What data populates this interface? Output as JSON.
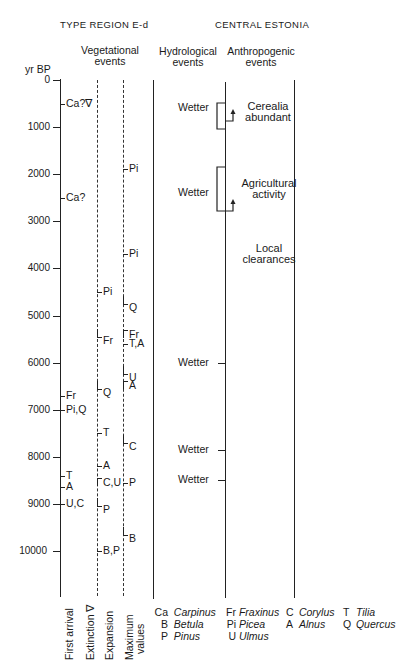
{
  "top_cut_text": "Estonia",
  "headers": {
    "left_region": "TYPE REGION E-d",
    "right_region": "CENTRAL ESTONIA",
    "vegetational": [
      "Vegetational",
      "events"
    ],
    "hydrological": [
      "Hydrological",
      "events"
    ],
    "anthropogenic": [
      "Anthropogenic",
      "events"
    ]
  },
  "axis": {
    "unit": "yr BP",
    "ticks": [
      "0",
      "1000",
      "2000",
      "3000",
      "4000",
      "5000",
      "6000",
      "7000",
      "8000",
      "9000",
      "10000"
    ]
  },
  "first_arrival": [
    {
      "label": "Ca?∇",
      "yr": 500
    },
    {
      "label": "Ca?",
      "yr": 2500
    },
    {
      "label": "Fr",
      "yr": 6700
    },
    {
      "label": "Pi,Q",
      "yr": 7000
    },
    {
      "label": "T",
      "yr": 8400
    },
    {
      "label": "A",
      "yr": 8650
    },
    {
      "label": "U,C",
      "yr": 9000
    }
  ],
  "expansion": [
    {
      "label": "Pi",
      "yr": 4500
    },
    {
      "label": "Fr",
      "yr": 5450
    },
    {
      "label": "Q",
      "yr": 6550
    },
    {
      "label": "T",
      "yr": 7500
    },
    {
      "label": "A",
      "yr": 8200
    },
    {
      "label": "C,U",
      "yr": 8450
    },
    {
      "label": "P",
      "yr": 9050
    },
    {
      "label": "B,P",
      "yr": 10000
    }
  ],
  "maximum_values": [
    {
      "label": "Pi",
      "yr": 1900
    },
    {
      "label": "Pi",
      "yr": 3700
    },
    {
      "label": "Q",
      "yr": 4750
    },
    {
      "label": "Fr",
      "yr": 5300
    },
    {
      "label": "T,A",
      "yr": 5600
    },
    {
      "label": "U",
      "yr": 6250
    },
    {
      "label": "A",
      "yr": 6400
    },
    {
      "label": "C",
      "yr": 7700
    },
    {
      "label": "P",
      "yr": 8550
    },
    {
      "label": "B",
      "yr": 9650
    }
  ],
  "hydrological_events": [
    {
      "label": "Wetter",
      "yr": 600
    },
    {
      "label": "Wetter",
      "yr": 2400
    },
    {
      "label": "Wetter",
      "yr": 6000
    },
    {
      "label": "Wetter",
      "yr": 7850
    },
    {
      "label": "Wetter",
      "yr": 8500
    }
  ],
  "anthropogenic_events": [
    {
      "label": [
        "Cerealia",
        "abundant"
      ]
    },
    {
      "label": [
        "Agricultural",
        "activity"
      ]
    },
    {
      "label": [
        "Local",
        "clearances"
      ]
    }
  ],
  "column_labels": {
    "first_arrival": "First arrival",
    "extinction": "Extinction ∇",
    "expansion": "Expansion",
    "maximum": [
      "Maximum",
      "values"
    ]
  },
  "legend": [
    {
      "abbr": "Ca",
      "name": "Carpinus"
    },
    {
      "abbr": "B",
      "name": "Betula"
    },
    {
      "abbr": "P",
      "name": "Pinus"
    },
    {
      "abbr": "Fr",
      "name": "Fraxinus"
    },
    {
      "abbr": "Pi",
      "name": "Picea"
    },
    {
      "abbr": "U",
      "name": "Ulmus"
    },
    {
      "abbr": "C",
      "name": "Corylus"
    },
    {
      "abbr": "A",
      "name": "Alnus"
    },
    {
      "abbr": "T",
      "name": "Tilia"
    },
    {
      "abbr": "Q",
      "name": "Quercus"
    }
  ]
}
